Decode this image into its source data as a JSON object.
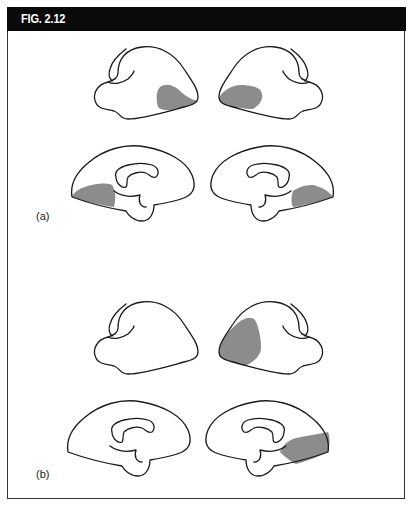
{
  "figure": {
    "title": "FIG. 2.12",
    "header_bg": "#0a0a0a",
    "header_fg": "#ffffff",
    "lesion_color": "#8c8c8c"
  },
  "panels": [
    {
      "label": "(a)",
      "views": [
        {
          "view": "lateral",
          "hemisphere": "left",
          "lesion": "posterior-inferior (occipito-temporal)"
        },
        {
          "view": "lateral",
          "hemisphere": "right",
          "lesion": "posterior-inferior (occipito-temporal)"
        },
        {
          "view": "medial",
          "hemisphere": "left",
          "lesion": "inferior occipital"
        },
        {
          "view": "medial",
          "hemisphere": "right",
          "lesion": "inferior occipital"
        }
      ]
    },
    {
      "label": "(b)",
      "views": [
        {
          "view": "lateral",
          "hemisphere": "left",
          "lesion": "none"
        },
        {
          "view": "lateral",
          "hemisphere": "right",
          "lesion": "frontal/anterior"
        },
        {
          "view": "medial",
          "hemisphere": "left",
          "lesion": "none"
        },
        {
          "view": "medial",
          "hemisphere": "right",
          "lesion": "inferior occipito-temporal"
        }
      ]
    }
  ]
}
